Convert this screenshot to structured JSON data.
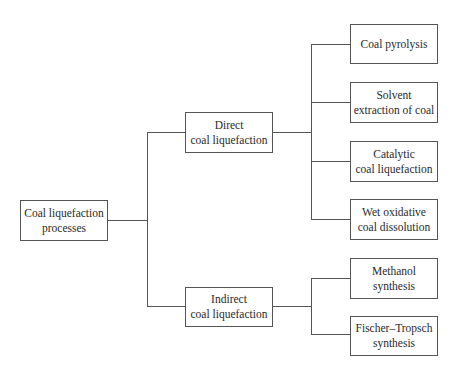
{
  "diagram": {
    "type": "tree",
    "root": {
      "label_line1": "Coal liquefaction",
      "label_line2": "processes"
    },
    "branches": [
      {
        "label_line1": "Direct",
        "label_line2": "coal liquefaction",
        "children": [
          {
            "label_line1": "Coal pyrolysis",
            "label_line2": ""
          },
          {
            "label_line1": "Solvent",
            "label_line2": "extraction of coal"
          },
          {
            "label_line1": "Catalytic",
            "label_line2": "coal liquefaction"
          },
          {
            "label_line1": "Wet oxidative",
            "label_line2": "coal dissolution"
          }
        ]
      },
      {
        "label_line1": "Indirect",
        "label_line2": "coal liquefaction",
        "children": [
          {
            "label_line1": "Methanol",
            "label_line2": "synthesis"
          },
          {
            "label_line1": "Fischer–Tropsch",
            "label_line2": "synthesis"
          }
        ]
      }
    ]
  },
  "colors": {
    "line": "#555555",
    "text": "#2a2a2a",
    "background": "#ffffff"
  }
}
